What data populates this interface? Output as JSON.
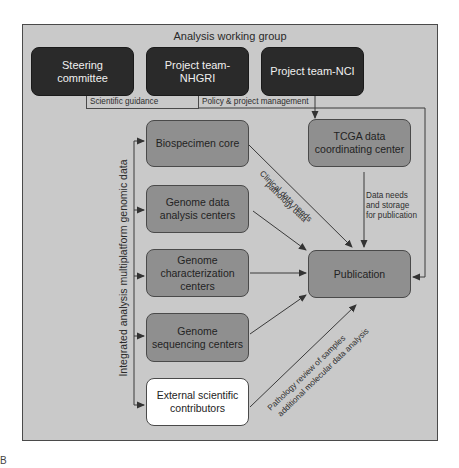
{
  "panel_letter": "B",
  "group_title": "Analysis working group",
  "leadership": [
    {
      "id": "steering",
      "label": "Steering committee"
    },
    {
      "id": "nhgri",
      "label": "Project team-NHGRI"
    },
    {
      "id": "nci",
      "label": "Project team-NCI"
    }
  ],
  "leadership_labels": {
    "scientific_guidance": "Scientific guidance",
    "policy": "Policy & project management"
  },
  "centers": [
    {
      "id": "biospecimen",
      "label": "Biospecimen core"
    },
    {
      "id": "gdac",
      "label": "Genome data analysis centers"
    },
    {
      "id": "gcc",
      "label": "Genome characterization centers"
    },
    {
      "id": "gsc",
      "label": "Genome sequencing centers"
    },
    {
      "id": "external",
      "label": "External scientific contributors"
    }
  ],
  "dcc": {
    "label": "TCGA data coordinating center"
  },
  "publication": {
    "label": "Publication"
  },
  "vertical_label": "Integrated analysis multiplatform genomic data",
  "edge_labels": {
    "clinical_line1": "Clinical data needs",
    "clinical_line2": "pathology data",
    "dcc_line1": "Data needs",
    "dcc_line2": "and storage",
    "dcc_line3": "for publication",
    "external_line1": "Pathology review of samples",
    "external_line2": "additional molecular data analysis"
  },
  "colors": {
    "frame_bg": "#c9c9c9",
    "dark_box": "#2a2a2a",
    "mid_box": "#8f8f8f",
    "light_box": "#ffffff",
    "line": "#3a3a3a"
  }
}
